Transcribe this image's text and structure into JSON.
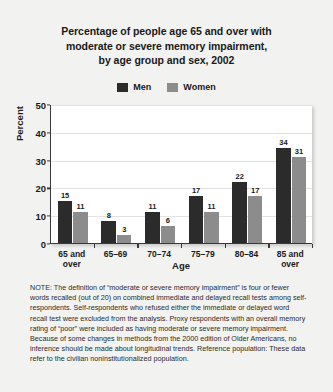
{
  "chart_data": {
    "type": "bar",
    "title": "Percentage of people age 65 and over with moderate or severe memory impairment, by age group and sex, 2002",
    "title_lines": [
      "Percentage of people age 65 and over with",
      "moderate or severe memory impairment,",
      "by age group and sex, 2002"
    ],
    "xlabel": "Age",
    "ylabel": "Percent",
    "ylim": [
      0,
      50
    ],
    "yticks": [
      0,
      10,
      20,
      30,
      40,
      50
    ],
    "grid": "horizontal",
    "legend_position": "top-center",
    "categories": [
      "65 and over",
      "65–69",
      "70–74",
      "75–79",
      "80–84",
      "85 and over"
    ],
    "category_lines": [
      [
        "65 and",
        "over"
      ],
      [
        "65–69",
        ""
      ],
      [
        "70–74",
        ""
      ],
      [
        "75–79",
        ""
      ],
      [
        "80–84",
        ""
      ],
      [
        "85 and",
        "over"
      ]
    ],
    "series": [
      {
        "name": "Men",
        "color": "#2b2b2b",
        "values": [
          15,
          8,
          11,
          17,
          22,
          34
        ]
      },
      {
        "name": "Women",
        "color": "#8c8c8c",
        "values": [
          11,
          3,
          6,
          11,
          17,
          31
        ]
      }
    ]
  },
  "note": {
    "text": "NOTE: The definition of “moderate or severe memory impairment” is four or fewer words recalled (out of 20) on combined immediate and delayed recall tests among self-respondents. Self-respondents who refused either the immediate or delayed word recall test were excluded from the analysis. Proxy respondents with an overall memory rating of “poor” were included as having moderate or severe memory impairment. Because of some changes in methods from the 2000 edition of Older Americans, no inference should be made about longitudinal trends. Reference population: These data refer to the civilian noninstitutionalized population."
  },
  "colors": {
    "background": "#f2f2f0",
    "plot_background": "#ffffff",
    "axis": "#3a3a3a",
    "gridline": "#e2e2e2",
    "men": "#2b2b2b",
    "women": "#8c8c8c",
    "text": "#1a1a1a"
  }
}
